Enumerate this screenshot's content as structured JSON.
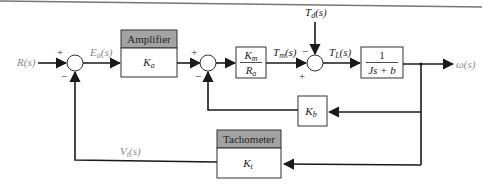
{
  "diagram": {
    "type": "block-diagram",
    "signals": {
      "input": "R(s)",
      "error": "E_a(s)",
      "motor_torque": "T_m(s)",
      "disturbance": "T_d(s)",
      "load_torque": "T_L(s)",
      "output": "ω(s)",
      "tach_voltage": "V_t(s)"
    },
    "blocks": {
      "amplifier": {
        "header": "Amplifier",
        "gain": "K",
        "gain_sub": "a"
      },
      "motor": {
        "num": "K",
        "num_sub": "m",
        "den": "R",
        "den_sub": "a"
      },
      "plant": {
        "num": "1",
        "den": "Js + b"
      },
      "back_emf": {
        "gain": "K",
        "gain_sub": "b"
      },
      "tachometer": {
        "header": "Tachometer",
        "gain": "K",
        "gain_sub": "t"
      }
    },
    "summers": {
      "s1": {
        "top": "+",
        "bottom": "−"
      },
      "s2": {
        "top": "+",
        "bottom": "−"
      },
      "s3": {
        "top": "−",
        "bottom": "+"
      }
    }
  }
}
